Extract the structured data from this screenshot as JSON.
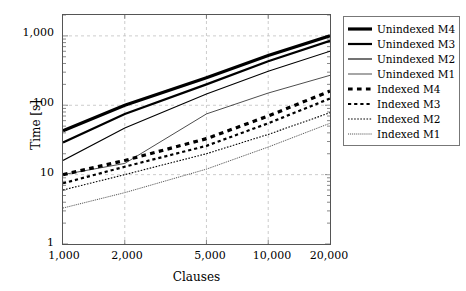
{
  "chart_data": {
    "type": "line",
    "title": "",
    "xlabel": "Clauses",
    "ylabel": "Time [s]",
    "xscale": "log",
    "yscale": "log",
    "xlim": [
      1000,
      20000
    ],
    "ylim": [
      1,
      2000
    ],
    "grid": true,
    "legend_position": "right-outside",
    "xticks": [
      "1,000",
      "2,000",
      "5,000",
      "10,000",
      "20,000"
    ],
    "xtick_values": [
      1000,
      2000,
      5000,
      10000,
      20000
    ],
    "yticks": [
      "1",
      "10",
      "100",
      "1,000"
    ],
    "ytick_values": [
      1,
      10,
      100,
      1000
    ],
    "x": [
      1000,
      2000,
      5000,
      10000,
      20000
    ],
    "series": [
      {
        "name": "Unindexed M4",
        "style": "solid",
        "width": 3.2,
        "color": "#000000",
        "values": [
          43,
          100,
          250,
          520,
          1000
        ]
      },
      {
        "name": "Unindexed M3",
        "style": "solid",
        "width": 2.2,
        "color": "#000000",
        "values": [
          29,
          75,
          200,
          430,
          850
        ]
      },
      {
        "name": "Unindexed M2",
        "style": "solid",
        "width": 1.1,
        "color": "#000000",
        "values": [
          16,
          47,
          145,
          310,
          600
        ]
      },
      {
        "name": "Unindexed M1",
        "style": "solid",
        "width": 0.7,
        "color": "#000000",
        "values": [
          10,
          14.5,
          75,
          150,
          270
        ]
      },
      {
        "name": "Indexed M4",
        "style": "dashed",
        "width": 3.2,
        "color": "#000000",
        "values": [
          10,
          16,
          33,
          70,
          160
        ]
      },
      {
        "name": "Indexed M3",
        "style": "dashed",
        "width": 2.2,
        "color": "#000000",
        "values": [
          7.5,
          13,
          26,
          55,
          125
        ]
      },
      {
        "name": "Indexed M2",
        "style": "dashed",
        "width": 1.1,
        "color": "#000000",
        "values": [
          6,
          10,
          20,
          38,
          78
        ]
      },
      {
        "name": "Indexed M1",
        "style": "dashed",
        "width": 0.7,
        "color": "#000000",
        "values": [
          3.3,
          5.5,
          12,
          25,
          55
        ]
      }
    ]
  },
  "legend": {
    "entries": [
      "Unindexed M4",
      "Unindexed M3",
      "Unindexed M2",
      "Unindexed M1",
      "Indexed M4",
      "Indexed M3",
      "Indexed M2",
      "Indexed M1"
    ]
  },
  "axes": {
    "x_label": "Clauses",
    "y_label": "Time [s]",
    "x_ticks": [
      "1,000",
      "2,000",
      "5,000",
      "10,000",
      "20,000"
    ],
    "y_ticks": [
      "1,000",
      "100",
      "10",
      "1"
    ]
  },
  "colors": {
    "line": "#000000",
    "grid": "#bfbfbf",
    "frame": "#555555",
    "background": "#ffffff"
  }
}
